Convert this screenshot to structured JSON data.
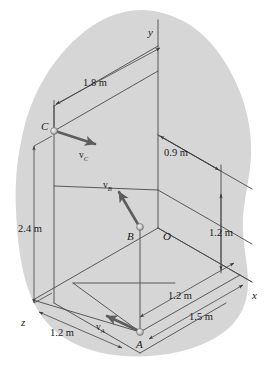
{
  "figure": {
    "background_color": "#ffffff",
    "blob_color": "#d6d6d6",
    "line_color": "#4a4a4a",
    "vector_color": "#5a5a5a",
    "text_color": "#1a1a1a"
  },
  "axes": [
    {
      "name": "y-axis",
      "label": "y"
    },
    {
      "name": "x-axis",
      "label": "x"
    },
    {
      "name": "z-axis",
      "label": "z"
    }
  ],
  "axis_labels": {
    "x": "x",
    "y": "y",
    "z": "z"
  },
  "points": [
    {
      "name": "point-o",
      "label": "O"
    },
    {
      "name": "point-a",
      "label": "A"
    },
    {
      "name": "point-b",
      "label": "B"
    },
    {
      "name": "point-c",
      "label": "C"
    }
  ],
  "point_labels": {
    "o": "O",
    "a": "A",
    "b": "B",
    "c": "C"
  },
  "vectors": [
    {
      "name": "velocity-vector-a",
      "base": "v",
      "sub": "A"
    },
    {
      "name": "velocity-vector-b",
      "base": "v",
      "sub": "B"
    },
    {
      "name": "velocity-vector-c",
      "base": "v",
      "sub": "C"
    }
  ],
  "vector_labels": {
    "va_base": "v",
    "va_sub": "A",
    "vb_base": "v",
    "vb_sub": "B",
    "vc_base": "v",
    "vc_sub": "C"
  },
  "dimensions": [
    {
      "name": "dim-1-8m",
      "value": "1.8 m"
    },
    {
      "name": "dim-0-9m",
      "value": "0.9 m"
    },
    {
      "name": "dim-2-4m",
      "value": "2.4 m"
    },
    {
      "name": "dim-1-2m-right",
      "value": "1.2 m"
    },
    {
      "name": "dim-1-2m-mid",
      "value": "1.2 m"
    },
    {
      "name": "dim-1-5m",
      "value": "1.5 m"
    },
    {
      "name": "dim-1-2m-left",
      "value": "1.2 m"
    }
  ],
  "dimension_labels": {
    "d18": "1.8 m",
    "d09": "0.9 m",
    "d24": "2.4 m",
    "d12_right": "1.2 m",
    "d12_mid": "1.2 m",
    "d15": "1.5 m",
    "d12_left": "1.2 m"
  }
}
